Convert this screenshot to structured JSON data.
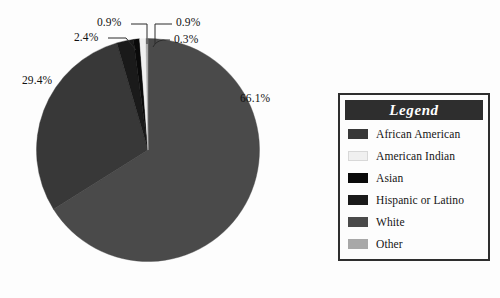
{
  "background": "#fdfdfd",
  "chart_data": {
    "type": "pie",
    "title": "",
    "start_angle_deg": 0,
    "direction": "clockwise",
    "legend_position": "right",
    "grid": false,
    "categories": [
      "White",
      "African American",
      "Hispanic or Latino",
      "Asian",
      "American Indian",
      "Other"
    ],
    "values": [
      66.1,
      29.4,
      2.4,
      0.9,
      0.9,
      0.3
    ],
    "value_labels": [
      "66.1%",
      "29.4%",
      "2.4%",
      "0.9%",
      "0.9%",
      "0.3%"
    ],
    "colors": [
      "#4a4a4a",
      "#383838",
      "#1a1a1a",
      "#0a0a0a",
      "#f0f0f0",
      "#a8a8a8"
    ],
    "units": "percent"
  },
  "labels": {
    "white_pct": "66.1%",
    "african_american_pct": "29.4%",
    "hispanic_pct": "2.4%",
    "asian_pct": "0.9%",
    "american_indian_pct": "0.9%",
    "other_pct": "0.3%"
  },
  "legend": {
    "title": "Legend",
    "title_color": "#ffffff",
    "header_bg": "#2e2e2e",
    "border_color": "#2e2e2e",
    "items": [
      {
        "label": "African American",
        "color": "#383838"
      },
      {
        "label": "American Indian",
        "color": "#f0f0f0"
      },
      {
        "label": "Asian",
        "color": "#0a0a0a"
      },
      {
        "label": "Hispanic or Latino",
        "color": "#1a1a1a"
      },
      {
        "label": "White",
        "color": "#4a4a4a"
      },
      {
        "label": "Other",
        "color": "#a8a8a8"
      }
    ]
  }
}
